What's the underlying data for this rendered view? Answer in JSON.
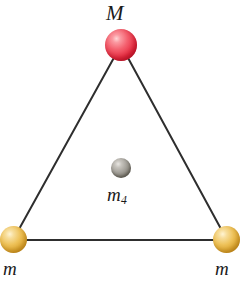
{
  "figure": {
    "background_color": "#ffffff",
    "width": 241,
    "height": 287
  },
  "diagram": {
    "type": "physics-free-body-diagram",
    "shape": "equilateral-triangle",
    "edge_color": "#2e2e2e",
    "edge_width": 2,
    "nodes": [
      {
        "id": "M",
        "label": "M",
        "role": "apex-mass",
        "color": "#e8293f",
        "highlight_color": "#ffd6d6",
        "cx": 121,
        "cy": 45,
        "r": 16,
        "label_position": "above"
      },
      {
        "id": "m_left",
        "label": "m",
        "role": "bottom-left-mass",
        "color": "#e0a82f",
        "highlight_color": "#fff4d2",
        "cx": 13,
        "cy": 240,
        "r": 13.5,
        "label_position": "below"
      },
      {
        "id": "m_right",
        "label": "m",
        "role": "bottom-right-mass",
        "color": "#e0a82f",
        "highlight_color": "#fff4d2",
        "cx": 227,
        "cy": 240,
        "r": 13.5,
        "label_position": "below"
      },
      {
        "id": "m4",
        "label": "m",
        "label_subscript": "4",
        "role": "center-mass",
        "color": "#868278",
        "highlight_color": "#e8e6e2",
        "cx": 121,
        "cy": 168,
        "r": 10,
        "label_position": "below"
      }
    ],
    "edges": [
      {
        "from": "M",
        "to": "m_left",
        "name": "left-side"
      },
      {
        "from": "M",
        "to": "m_right",
        "name": "right-side"
      },
      {
        "from": "m_left",
        "to": "m_right",
        "name": "base-side"
      }
    ]
  }
}
